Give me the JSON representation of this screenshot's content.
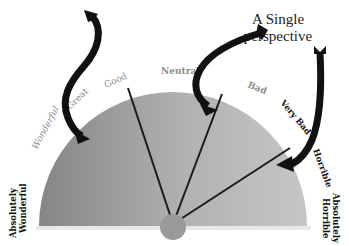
{
  "diagram": {
    "title_lines": [
      "A Single",
      "perspective"
    ],
    "scale_labels": [
      {
        "text": "Absolutely Wonderful",
        "lines": [
          "Absolutely",
          "Wonderful"
        ],
        "style": "dark"
      },
      {
        "text": "Wonderful",
        "style": "light"
      },
      {
        "text": "Great",
        "style": "light"
      },
      {
        "text": "Good",
        "style": "light"
      },
      {
        "text": "Neutral",
        "style": "light"
      },
      {
        "text": "Bad",
        "style": "light"
      },
      {
        "text": "Very Bad",
        "style": "dark"
      },
      {
        "text": "Horrible",
        "style": "dark"
      },
      {
        "text": "Absolutely Horrible",
        "lines": [
          "Absolutely",
          "Horrible"
        ],
        "style": "dark"
      }
    ],
    "needles": [
      {
        "name": "needle-good",
        "points_to": "Good"
      },
      {
        "name": "needle-bad",
        "points_to": "Bad"
      },
      {
        "name": "needle-horrible",
        "points_to": "Horrible"
      }
    ],
    "arrows": [
      {
        "name": "arrow-to-wonderful",
        "target": "Wonderful"
      },
      {
        "name": "arrow-to-bad",
        "target": "Bad",
        "source": "A Single perspective"
      },
      {
        "name": "arrow-to-horrible",
        "target": "Horrible",
        "source": "A Single perspective"
      }
    ],
    "colors": {
      "gauge_dark": "#8a8a8a",
      "gauge_light": "#c4c4c4",
      "needle": "#1a1a1a",
      "arrow": "#111111",
      "hub": "#9a9a9a"
    }
  }
}
